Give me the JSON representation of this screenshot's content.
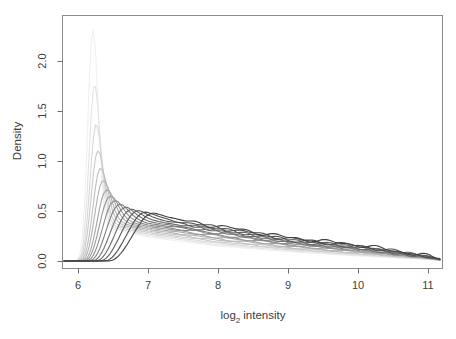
{
  "colors": {
    "background": "#ffffff",
    "box": "#8a8a8a",
    "tick": "#6e6e6e",
    "text": "#3d3d3d",
    "curve_lightest": "#f0f0f0",
    "curve_darkest": "#404040"
  },
  "labels": {
    "ylabel": "Density",
    "xlabel_prefix": "log",
    "xlabel_sub": "2",
    "xlabel_suffix": "intensity",
    "x_ticks": [
      "6",
      "7",
      "8",
      "9",
      "10",
      "11"
    ],
    "y_ticks": [
      "0.0",
      "0.5",
      "1.0",
      "1.5",
      "2.0"
    ]
  },
  "chart_data": {
    "type": "line",
    "subtype": "density-curves",
    "title": "",
    "xlabel": "log2 intensity",
    "ylabel": "Density",
    "xlim": [
      5.79,
      11.2
    ],
    "ylim": [
      -0.07,
      2.46
    ],
    "x_ticks": [
      6,
      7,
      8,
      9,
      10,
      11
    ],
    "y_ticks": [
      0,
      0.5,
      1,
      1.5,
      2
    ],
    "grid": false,
    "legend": "none",
    "n_series": 15,
    "series_note": "each series: peak [x,y]; tail = density value at x=7,8,9,10,11 and at right end x=11.18; sigma = [left,right] peak widths",
    "series": [
      {
        "name": "curve-01",
        "color": "#f0f0f0",
        "peak": [
          6.21,
          2.32
        ],
        "sigma": [
          0.07,
          0.075
        ],
        "tail": {
          "7": 0.24,
          "8": 0.15,
          "9": 0.095,
          "10": 0.05,
          "11": 0.015,
          "end": 0.005
        },
        "wiggle": 0.0
      },
      {
        "name": "curve-02",
        "color": "#e3e3e3",
        "peak": [
          6.23,
          1.76
        ],
        "sigma": [
          0.074,
          0.082
        ],
        "tail": {
          "7": 0.255,
          "8": 0.164,
          "9": 0.105,
          "10": 0.058,
          "11": 0.018,
          "end": 0.006
        },
        "wiggle": 0.002
      },
      {
        "name": "curve-03",
        "color": "#d7d7d7",
        "peak": [
          6.25,
          1.36
        ],
        "sigma": [
          0.079,
          0.09
        ],
        "tail": {
          "7": 0.27,
          "8": 0.179,
          "9": 0.115,
          "10": 0.066,
          "11": 0.02,
          "end": 0.007
        },
        "wiggle": 0.003
      },
      {
        "name": "curve-04",
        "color": "#cacaca",
        "peak": [
          6.27,
          1.09
        ],
        "sigma": [
          0.084,
          0.098
        ],
        "tail": {
          "7": 0.285,
          "8": 0.193,
          "9": 0.125,
          "10": 0.074,
          "11": 0.023,
          "end": 0.008
        },
        "wiggle": 0.005
      },
      {
        "name": "curve-05",
        "color": "#bebebe",
        "peak": [
          6.3,
          0.91
        ],
        "sigma": [
          0.09,
          0.107
        ],
        "tail": {
          "7": 0.3,
          "8": 0.207,
          "9": 0.135,
          "10": 0.081,
          "11": 0.025,
          "end": 0.008
        },
        "wiggle": 0.007
      },
      {
        "name": "curve-06",
        "color": "#b1b1b1",
        "peak": [
          6.33,
          0.78
        ],
        "sigma": [
          0.096,
          0.117
        ],
        "tail": {
          "7": 0.315,
          "8": 0.221,
          "9": 0.145,
          "10": 0.089,
          "11": 0.028,
          "end": 0.009
        },
        "wiggle": 0.009
      },
      {
        "name": "curve-07",
        "color": "#a5a5a5",
        "peak": [
          6.37,
          0.68
        ],
        "sigma": [
          0.103,
          0.128
        ],
        "tail": {
          "7": 0.33,
          "8": 0.236,
          "9": 0.155,
          "10": 0.097,
          "11": 0.03,
          "end": 0.01
        },
        "wiggle": 0.01
      },
      {
        "name": "curve-08",
        "color": "#989898",
        "peak": [
          6.41,
          0.61
        ],
        "sigma": [
          0.111,
          0.14
        ],
        "tail": {
          "7": 0.345,
          "8": 0.25,
          "9": 0.165,
          "10": 0.105,
          "11": 0.033,
          "end": 0.011
        },
        "wiggle": 0.012
      },
      {
        "name": "curve-09",
        "color": "#8b8b8b",
        "peak": [
          6.46,
          0.56
        ],
        "sigma": [
          0.12,
          0.153
        ],
        "tail": {
          "7": 0.36,
          "8": 0.264,
          "9": 0.175,
          "10": 0.113,
          "11": 0.035,
          "end": 0.012
        },
        "wiggle": 0.014
      },
      {
        "name": "curve-10",
        "color": "#7f7f7f",
        "peak": [
          6.52,
          0.52
        ],
        "sigma": [
          0.13,
          0.167
        ],
        "tail": {
          "7": 0.375,
          "8": 0.279,
          "9": 0.185,
          "10": 0.12,
          "11": 0.038,
          "end": 0.013
        },
        "wiggle": 0.016
      },
      {
        "name": "curve-11",
        "color": "#727272",
        "peak": [
          6.59,
          0.49
        ],
        "sigma": [
          0.141,
          0.182
        ],
        "tail": {
          "7": 0.39,
          "8": 0.293,
          "9": 0.195,
          "10": 0.128,
          "11": 0.04,
          "end": 0.014
        },
        "wiggle": 0.017
      },
      {
        "name": "curve-12",
        "color": "#666666",
        "peak": [
          6.67,
          0.47
        ],
        "sigma": [
          0.153,
          0.198
        ],
        "tail": {
          "7": 0.405,
          "8": 0.307,
          "9": 0.205,
          "10": 0.136,
          "11": 0.043,
          "end": 0.015
        },
        "wiggle": 0.019
      },
      {
        "name": "curve-13",
        "color": "#595959",
        "peak": [
          6.76,
          0.46
        ],
        "sigma": [
          0.166,
          0.215
        ],
        "tail": {
          "7": 0.42,
          "8": 0.321,
          "9": 0.215,
          "10": 0.144,
          "11": 0.045,
          "end": 0.016
        },
        "wiggle": 0.02
      },
      {
        "name": "curve-14",
        "color": "#4c4c4c",
        "peak": [
          6.86,
          0.45
        ],
        "sigma": [
          0.18,
          0.233
        ],
        "tail": {
          "7": 0.435,
          "8": 0.336,
          "9": 0.225,
          "10": 0.152,
          "11": 0.048,
          "end": 0.017
        },
        "wiggle": 0.022
      },
      {
        "name": "curve-15",
        "color": "#404040",
        "peak": [
          6.96,
          0.44
        ],
        "sigma": [
          0.195,
          0.252
        ],
        "tail": {
          "7": 0.45,
          "8": 0.35,
          "9": 0.235,
          "10": 0.16,
          "11": 0.05,
          "end": 0.018
        },
        "wiggle": 0.024
      }
    ]
  }
}
